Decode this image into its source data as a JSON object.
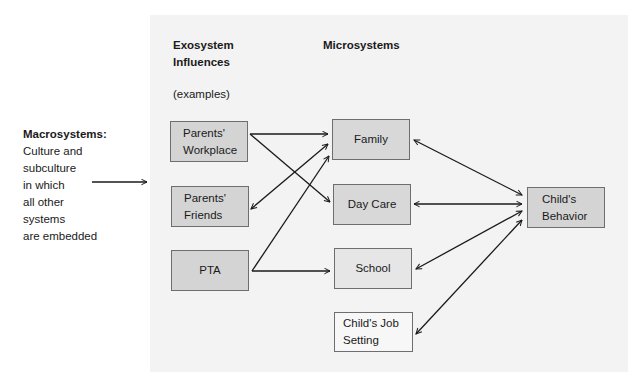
{
  "macrosystems": {
    "title": "Macrosystems:",
    "lines": [
      "Culture and",
      "subculture",
      "in which",
      "all other",
      "systems",
      "are embedded"
    ]
  },
  "exosystem": {
    "heading_line1": "Exosystem",
    "heading_line2": "Influences",
    "subheading": "(examples)",
    "boxes": [
      {
        "id": "parents-workplace",
        "lines": [
          "Parents'",
          "Workplace"
        ],
        "fill": "#d4d4d4"
      },
      {
        "id": "parents-friends",
        "lines": [
          "Parents'",
          "Friends"
        ],
        "fill": "#d4d4d4"
      },
      {
        "id": "pta",
        "lines": [
          "PTA"
        ],
        "fill": "#d4d4d4"
      }
    ]
  },
  "microsystems": {
    "heading": "Microsystems",
    "boxes": [
      {
        "id": "family",
        "lines": [
          "Family"
        ],
        "fill": "#d8d8d8"
      },
      {
        "id": "day-care",
        "lines": [
          "Day Care"
        ],
        "fill": "#d8d8d8"
      },
      {
        "id": "school",
        "lines": [
          "School"
        ],
        "fill": "#e6e6e6"
      },
      {
        "id": "childs-job-setting",
        "lines": [
          "Child's Job",
          "Setting"
        ],
        "fill": "#f7f7f7"
      }
    ]
  },
  "outcome": {
    "box": {
      "id": "childs-behavior",
      "lines": [
        "Child's",
        "Behavior"
      ],
      "fill": "#d4d4d4"
    }
  },
  "connections": [
    {
      "from": "macrosystems",
      "to": "panel",
      "type": "one-way"
    },
    {
      "from": "parents-workplace",
      "to": "family",
      "type": "one-way"
    },
    {
      "from": "parents-workplace",
      "to": "day-care",
      "type": "one-way"
    },
    {
      "from": "parents-friends",
      "to": "family",
      "type": "two-way"
    },
    {
      "from": "pta",
      "to": "family",
      "type": "one-way"
    },
    {
      "from": "pta",
      "to": "school",
      "type": "one-way"
    },
    {
      "from": "family",
      "to": "childs-behavior",
      "type": "two-way"
    },
    {
      "from": "day-care",
      "to": "childs-behavior",
      "type": "two-way"
    },
    {
      "from": "school",
      "to": "childs-behavior",
      "type": "two-way"
    },
    {
      "from": "childs-job-setting",
      "to": "childs-behavior",
      "type": "two-way"
    }
  ],
  "colors": {
    "panel": "#f3f3f3",
    "line": "#1a1a1a",
    "border": "#6e6e6e"
  }
}
